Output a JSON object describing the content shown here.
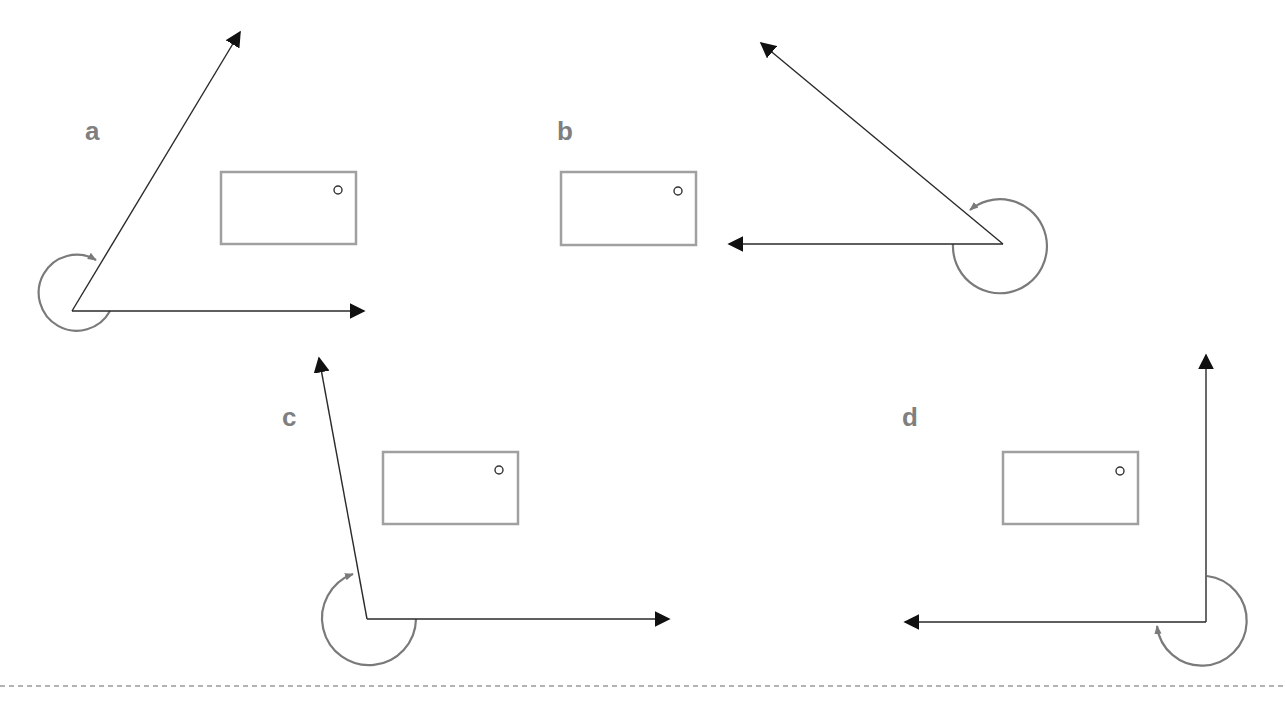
{
  "figure": {
    "type": "coordinate-system-orientation-diagram",
    "colors": {
      "axis": "#2a2a2a",
      "arc": "#7a7a7a",
      "board": "#a0a0a0",
      "label": "#7f7f7f",
      "divider": "#9a9a9a"
    },
    "panels": [
      {
        "id": "a",
        "label": "a",
        "label_pos": [
          85,
          140
        ],
        "origin": [
          72,
          311
        ],
        "axis_x_end": [
          368,
          311
        ],
        "axis_y_end": [
          242,
          28
        ],
        "arc": {
          "cx": 72,
          "cy": 311,
          "r": 38,
          "direction": "counterclockwise-to-y"
        },
        "board": {
          "x": 221,
          "y": 172,
          "w": 135,
          "h": 72,
          "dot": [
            338,
            190
          ]
        }
      },
      {
        "id": "b",
        "label": "b",
        "label_pos": [
          557,
          140
        ],
        "origin": [
          1005,
          244
        ],
        "axis_x_end": [
          725,
          244
        ],
        "axis_y_end": [
          758,
          40
        ],
        "arc": {
          "cx": 1000,
          "cy": 244,
          "r": 47,
          "direction": "clockwise-to-y"
        },
        "board": {
          "x": 561,
          "y": 172,
          "w": 135,
          "h": 73,
          "dot": [
            678,
            191
          ]
        }
      },
      {
        "id": "c",
        "label": "c",
        "label_pos": [
          282,
          426
        ],
        "origin": [
          367,
          619
        ],
        "axis_x_end": [
          673,
          619
        ],
        "axis_y_end": [
          318,
          354
        ],
        "arc": {
          "cx": 370,
          "cy": 619,
          "r": 47,
          "direction": "counterclockwise-to-y"
        },
        "board": {
          "x": 383,
          "y": 452,
          "w": 135,
          "h": 72,
          "dot": [
            499,
            470
          ]
        }
      },
      {
        "id": "d",
        "label": "d",
        "label_pos": [
          902,
          426
        ],
        "origin": [
          1206,
          622
        ],
        "axis_x_end": [
          901,
          622
        ],
        "axis_y_end": [
          1206,
          351
        ],
        "arc": {
          "cx": 1206,
          "cy": 622,
          "r": 45,
          "direction": "clockwise-from-y-to-x"
        },
        "board": {
          "x": 1003,
          "y": 452,
          "w": 135,
          "h": 72,
          "dot": [
            1120,
            471
          ]
        }
      }
    ],
    "divider": {
      "y": 686,
      "style": "dashed"
    }
  }
}
